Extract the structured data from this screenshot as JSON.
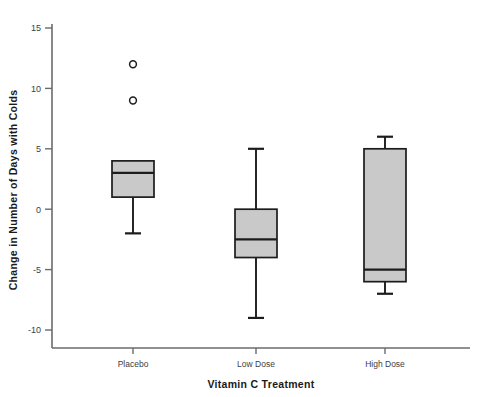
{
  "chart_data": {
    "type": "box",
    "title": "",
    "xlabel": "Vitamin C Treatment",
    "ylabel": "Change in Number of Days with Colds",
    "categories": [
      "Placebo",
      "Low Dose",
      "High Dose"
    ],
    "ylim": [
      -11.5,
      16.5
    ],
    "yticks": [
      15,
      10,
      5,
      0,
      -5,
      -10
    ],
    "ytick_labels": [
      "15",
      "10",
      "5",
      "0",
      "-5",
      "-10"
    ],
    "grid": false,
    "legend": "none",
    "box_fill_color": "#c9c9c9",
    "box_line_color": "#1c1c1c",
    "axis_color": "#6b6b6b",
    "boxes": [
      {
        "category": "Placebo",
        "whisker_low": -2,
        "q1": 1,
        "median": 3,
        "q3": 4,
        "whisker_high": 4,
        "outliers": [
          12,
          9
        ]
      },
      {
        "category": "Low Dose",
        "whisker_low": -9,
        "q1": -4,
        "median": -2.5,
        "q3": 0,
        "whisker_high": 5,
        "outliers": []
      },
      {
        "category": "High Dose",
        "whisker_low": -7,
        "q1": -6,
        "median": -5,
        "q3": 5,
        "whisker_high": 6,
        "outliers": []
      }
    ]
  }
}
